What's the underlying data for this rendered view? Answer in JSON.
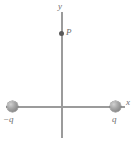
{
  "figure": {
    "type": "physics-diagram",
    "background_color": "#ffffff",
    "axis_color": "#9b9b9b",
    "label_color": "#6e6e6e",
    "charge_color": "#a0a0a0",
    "point_color": "#5a5a5a"
  },
  "axes": {
    "x_label": "x",
    "y_label": "y",
    "origin_label": ""
  },
  "charges": [
    {
      "id": "left-charge",
      "label": "−q",
      "sign": "negative",
      "position": {
        "x": -1,
        "y": 0
      }
    },
    {
      "id": "right-charge",
      "label": "q",
      "sign": "positive",
      "position": {
        "x": 1,
        "y": 0
      }
    }
  ],
  "points": [
    {
      "id": "point-p",
      "label": "P",
      "position": {
        "x": 0,
        "y": 1.45
      }
    }
  ]
}
